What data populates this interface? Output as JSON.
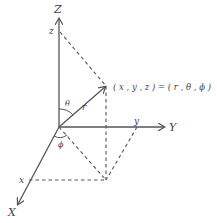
{
  "diagram": {
    "type": "spherical-coordinate-system",
    "axes": {
      "x_label": "X",
      "y_label": "Y",
      "z_label": "Z"
    },
    "ticks": {
      "x_tick": "x",
      "y_tick": "y",
      "z_tick": "z"
    },
    "vector": {
      "r_label": "r",
      "theta_label": "θ",
      "phi_label": "ϕ"
    },
    "point_label": "( x , y , z ) = ( r , θ , ϕ )",
    "colors": {
      "line": "#555555",
      "text": "#444444",
      "background": "#ffffff"
    }
  }
}
